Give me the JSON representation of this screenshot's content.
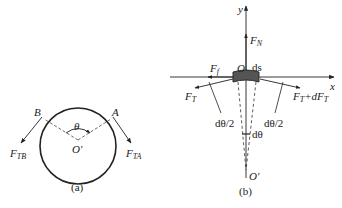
{
  "figure_a": {
    "caption": "(a)",
    "points": {
      "B": "B",
      "A": "A",
      "center": "O′"
    },
    "angle": "θ",
    "forces": {
      "left": {
        "main": "F",
        "sub": "TB"
      },
      "right": {
        "main": "F",
        "sub": "TA"
      }
    }
  },
  "figure_b": {
    "caption": "(b)",
    "axes": {
      "x": "x",
      "y": "y"
    },
    "origin": "O",
    "center": "O′",
    "element_label": "ds",
    "forces": {
      "normal": {
        "main": "F",
        "sub": "N"
      },
      "friction": {
        "main": "F",
        "sub": "f"
      },
      "tension_left": {
        "main": "F",
        "sub": "T"
      },
      "tension_right": {
        "main": "F",
        "sub": "T",
        "suffix": "+dF",
        "suffix_sub": "T"
      }
    },
    "angles": {
      "half_left": "dθ/2",
      "half_right": "dθ/2",
      "full": "dθ"
    }
  },
  "colors": {
    "stroke": "#222222",
    "block": "#555555"
  }
}
